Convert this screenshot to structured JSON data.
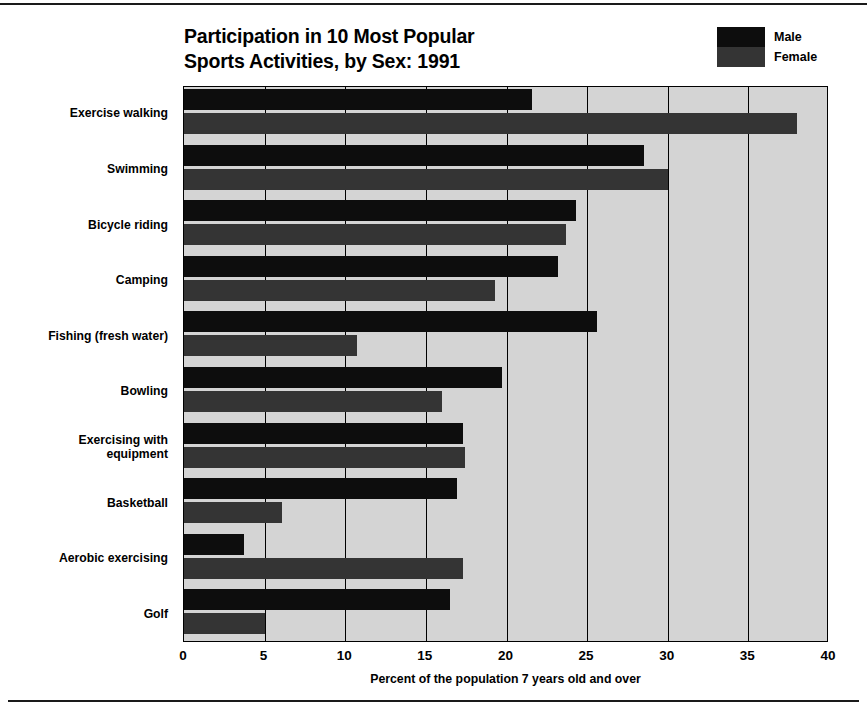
{
  "chart_data": {
    "type": "bar",
    "orientation": "horizontal",
    "title": "Participation in 10 Most Popular Sports Activities, by Sex: 1991",
    "title_lines": [
      "Participation in 10 Most Popular",
      "Sports Activities, by Sex: 1991"
    ],
    "xlabel": "Percent of the population 7 years old and over",
    "ylabel": "",
    "xlim": [
      0,
      40
    ],
    "xticks": [
      0,
      5,
      10,
      15,
      20,
      25,
      30,
      35,
      40
    ],
    "xtick_labels": [
      "0",
      "5",
      "10",
      "15",
      "20",
      "25",
      "30",
      "35",
      "40"
    ],
    "grid": true,
    "grid_axis": "x",
    "legend_position": "top-right",
    "categories": [
      "Exercise walking",
      "Swimming",
      "Bicycle riding",
      "Camping",
      "Fishing (fresh water)",
      "Bowling",
      "Exercising with equipment",
      "Basketball",
      "Aerobic exercising",
      "Golf"
    ],
    "category_label_lines": [
      [
        "Exercise walking"
      ],
      [
        "Swimming"
      ],
      [
        "Bicycle riding"
      ],
      [
        "Camping"
      ],
      [
        "Fishing (fresh water)"
      ],
      [
        "Bowling"
      ],
      [
        "Exercising with",
        "equipment"
      ],
      [
        "Basketball"
      ],
      [
        "Aerobic exercising"
      ],
      [
        "Golf"
      ]
    ],
    "series": [
      {
        "name": "Male",
        "color": "#0d0d0d",
        "values": [
          21.6,
          28.5,
          24.3,
          23.2,
          25.6,
          19.7,
          17.3,
          16.9,
          3.7,
          16.5
        ]
      },
      {
        "name": "Female",
        "color": "#343434",
        "values": [
          38.0,
          30.0,
          23.7,
          19.3,
          10.7,
          16.0,
          17.4,
          6.1,
          17.3,
          5.0
        ]
      }
    ],
    "plot_background": "#d4d4d4",
    "page_background": "#ffffff"
  },
  "legend": {
    "items": [
      {
        "label": "Male",
        "color": "#0d0d0d"
      },
      {
        "label": "Female",
        "color": "#343434"
      }
    ]
  }
}
